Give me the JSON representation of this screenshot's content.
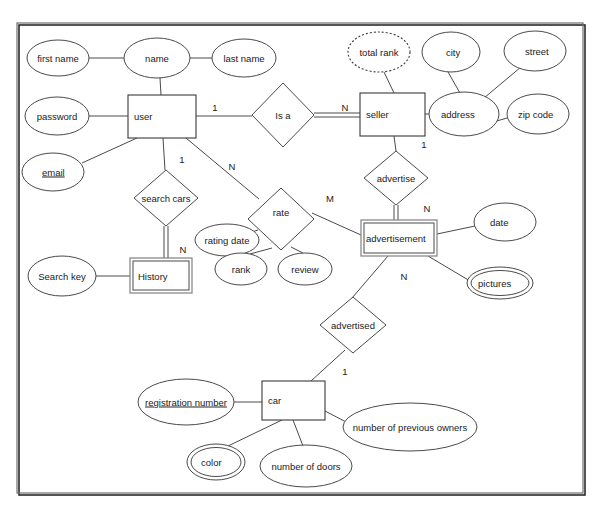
{
  "diagram": {
    "type": "entity-relationship-diagram",
    "notation": "Chen",
    "background": "#ffffff",
    "line_color": "#4a4a4a",
    "frame": {
      "x": 17,
      "y": 23,
      "width": 566,
      "height": 470
    }
  },
  "entities": [
    {
      "id": "user",
      "label": "user",
      "kind": "strong",
      "x": 128,
      "y": 95,
      "w": 68,
      "h": 43
    },
    {
      "id": "seller",
      "label": "seller",
      "kind": "strong",
      "x": 360,
      "y": 93,
      "w": 65,
      "h": 43
    },
    {
      "id": "history",
      "label": "History",
      "kind": "weak",
      "x": 130,
      "y": 258,
      "w": 62,
      "h": 35
    },
    {
      "id": "advertisement",
      "label": "advertisement",
      "kind": "weak",
      "x": 361,
      "y": 220,
      "w": 76,
      "h": 36
    },
    {
      "id": "car",
      "label": "car",
      "kind": "strong",
      "x": 262,
      "y": 381,
      "w": 63,
      "h": 39
    }
  ],
  "relationships": [
    {
      "id": "is-a",
      "label": "Is a",
      "cx": 283,
      "cy": 115,
      "rx": 31,
      "ry": 32
    },
    {
      "id": "search-cars",
      "label": "search cars",
      "cx": 166,
      "cy": 198,
      "rx": 32,
      "ry": 28
    },
    {
      "id": "advertise",
      "label": "advertise",
      "cx": 396,
      "cy": 178,
      "rx": 32,
      "ry": 27
    },
    {
      "id": "rate",
      "label": "rate",
      "cx": 281,
      "cy": 219,
      "rx": 33,
      "ry": 31
    },
    {
      "id": "advertised",
      "label": "advertised",
      "cx": 353,
      "cy": 325,
      "rx": 33,
      "ry": 28
    }
  ],
  "attributes": [
    {
      "id": "first-name",
      "label": "first name",
      "kind": "simple",
      "cx": 58,
      "cy": 58,
      "rx": 31,
      "ry": 18,
      "owner": "name"
    },
    {
      "id": "name",
      "label": "name",
      "kind": "simple",
      "cx": 157,
      "cy": 58,
      "rx": 33,
      "ry": 20,
      "owner": "user"
    },
    {
      "id": "last-name",
      "label": "last name",
      "kind": "simple",
      "cx": 244,
      "cy": 58,
      "rx": 32,
      "ry": 19,
      "owner": "name"
    },
    {
      "id": "password",
      "label": "password",
      "kind": "simple",
      "cx": 57,
      "cy": 116,
      "rx": 32,
      "ry": 19,
      "owner": "user"
    },
    {
      "id": "email",
      "label": "email",
      "kind": "key",
      "cx": 53,
      "cy": 172,
      "rx": 31,
      "ry": 19,
      "owner": "user"
    },
    {
      "id": "total-rank",
      "label": "total rank",
      "kind": "derived",
      "cx": 379,
      "cy": 52,
      "rx": 31,
      "ry": 20,
      "owner": "seller"
    },
    {
      "id": "city",
      "label": "city",
      "cx": 451,
      "cy": 52,
      "rx": 29,
      "ry": 20,
      "kind": "simple",
      "owner": "address"
    },
    {
      "id": "street",
      "label": "street",
      "cx": 535,
      "cy": 51,
      "rx": 31,
      "ry": 20,
      "kind": "simple",
      "owner": "address"
    },
    {
      "id": "address",
      "label": "address",
      "cx": 464,
      "cy": 114,
      "rx": 35,
      "ry": 22,
      "kind": "composite",
      "owner": "seller"
    },
    {
      "id": "zip-code",
      "label": "zip code",
      "cx": 538,
      "cy": 114,
      "rx": 31,
      "ry": 20,
      "kind": "simple",
      "owner": "address"
    },
    {
      "id": "search-key",
      "label": "Search key",
      "cx": 62,
      "cy": 276,
      "rx": 34,
      "ry": 20,
      "kind": "simple",
      "owner": "history"
    },
    {
      "id": "rating-date",
      "label": "rating date",
      "cx": 227,
      "cy": 240,
      "rx": 32,
      "ry": 16,
      "kind": "simple",
      "owner": "rate"
    },
    {
      "id": "rank",
      "label": "rank",
      "cx": 241,
      "cy": 269,
      "rx": 26,
      "ry": 16,
      "kind": "simple",
      "owner": "rate"
    },
    {
      "id": "review",
      "label": "review",
      "cx": 305,
      "cy": 269,
      "rx": 27,
      "ry": 16,
      "kind": "simple",
      "owner": "rate"
    },
    {
      "id": "date",
      "label": "date",
      "cx": 505,
      "cy": 222,
      "rx": 31,
      "ry": 19,
      "kind": "simple",
      "owner": "advertisement"
    },
    {
      "id": "pictures",
      "label": "pictures",
      "cx": 500,
      "cy": 283,
      "rx": 33,
      "ry": 16,
      "kind": "multivalued",
      "owner": "advertisement"
    },
    {
      "id": "reg-number",
      "label": "registration number",
      "cx": 186,
      "cy": 402,
      "rx": 48,
      "ry": 23,
      "kind": "key",
      "owner": "car"
    },
    {
      "id": "prev-owners",
      "label": "number of previous owners",
      "cx": 410,
      "cy": 427,
      "rx": 67,
      "ry": 24,
      "kind": "simple",
      "owner": "car"
    },
    {
      "id": "color",
      "label": "color",
      "cx": 216,
      "cy": 462,
      "rx": 29,
      "ry": 18,
      "kind": "multivalued",
      "owner": "car"
    },
    {
      "id": "doors",
      "label": "number of doors",
      "cx": 306,
      "cy": 466,
      "rx": 46,
      "ry": 21,
      "kind": "simple",
      "owner": "car"
    }
  ],
  "cardinalities": [
    {
      "id": "user-isa",
      "label": "1",
      "x": 215,
      "y": 108
    },
    {
      "id": "isa-seller",
      "label": "N",
      "x": 345,
      "y": 108
    },
    {
      "id": "user-searchcars",
      "label": "1",
      "x": 182,
      "y": 160
    },
    {
      "id": "user-rate",
      "label": "N",
      "x": 232,
      "y": 167
    },
    {
      "id": "searchcars-hist",
      "label": "N",
      "x": 183,
      "y": 250
    },
    {
      "id": "seller-advertise",
      "label": "1",
      "x": 424,
      "y": 145
    },
    {
      "id": "rate-ad",
      "label": "M",
      "x": 330,
      "y": 199
    },
    {
      "id": "advertise-ad",
      "label": "N",
      "x": 427,
      "y": 209
    },
    {
      "id": "ad-advertised",
      "label": "N",
      "x": 404,
      "y": 277
    },
    {
      "id": "advertised-car",
      "label": "1",
      "x": 345,
      "y": 372
    }
  ],
  "edges": [
    {
      "id": "e-firstname-name",
      "from": "first name",
      "to": "name",
      "style": "single"
    },
    {
      "id": "e-name-lastname",
      "from": "name",
      "to": "last name",
      "style": "single"
    },
    {
      "id": "e-name-user",
      "from": "name",
      "to": "user",
      "style": "single"
    },
    {
      "id": "e-password-user",
      "from": "password",
      "to": "user",
      "style": "single"
    },
    {
      "id": "e-email-user",
      "from": "email",
      "to": "user",
      "style": "single"
    },
    {
      "id": "e-user-isa",
      "from": "user",
      "to": "Is a",
      "style": "single"
    },
    {
      "id": "e-isa-seller",
      "from": "Is a",
      "to": "seller",
      "style": "double"
    },
    {
      "id": "e-totalrank-sel",
      "from": "total rank",
      "to": "seller",
      "style": "single"
    },
    {
      "id": "e-seller-addr",
      "from": "seller",
      "to": "address",
      "style": "single"
    },
    {
      "id": "e-city-addr",
      "from": "city",
      "to": "address",
      "style": "single"
    },
    {
      "id": "e-street-addr",
      "from": "street",
      "to": "address",
      "style": "single"
    },
    {
      "id": "e-addr-zip",
      "from": "address",
      "to": "zip code",
      "style": "single"
    },
    {
      "id": "e-user-search",
      "from": "user",
      "to": "search cars",
      "style": "single"
    },
    {
      "id": "e-search-hist",
      "from": "search cars",
      "to": "History",
      "style": "double"
    },
    {
      "id": "e-searchkey-hist",
      "from": "Search key",
      "to": "History",
      "style": "single"
    },
    {
      "id": "e-user-rate",
      "from": "user",
      "to": "rate",
      "style": "single"
    },
    {
      "id": "e-rate-ratedate",
      "from": "rate",
      "to": "rating date",
      "style": "single"
    },
    {
      "id": "e-rate-rank",
      "from": "rate",
      "to": "rank",
      "style": "single"
    },
    {
      "id": "e-rate-review",
      "from": "rate",
      "to": "review",
      "style": "single"
    },
    {
      "id": "e-rate-ad",
      "from": "rate",
      "to": "advertisement",
      "style": "single"
    },
    {
      "id": "e-seller-adv",
      "from": "seller",
      "to": "advertise",
      "style": "single"
    },
    {
      "id": "e-adv-ad",
      "from": "advertise",
      "to": "advertisement",
      "style": "double"
    },
    {
      "id": "e-ad-date",
      "from": "advertisement",
      "to": "date",
      "style": "single"
    },
    {
      "id": "e-ad-pictures",
      "from": "advertisement",
      "to": "pictures",
      "style": "single"
    },
    {
      "id": "e-ad-advertised",
      "from": "advertisement",
      "to": "advertised",
      "style": "single"
    },
    {
      "id": "e-advertised-car",
      "from": "advertised",
      "to": "car",
      "style": "single"
    },
    {
      "id": "e-reg-car",
      "from": "registration number",
      "to": "car",
      "style": "single"
    },
    {
      "id": "e-car-prev",
      "from": "car",
      "to": "number of previous owners",
      "style": "single"
    },
    {
      "id": "e-car-color",
      "from": "car",
      "to": "color",
      "style": "single"
    },
    {
      "id": "e-car-doors",
      "from": "car",
      "to": "number of doors",
      "style": "single"
    }
  ]
}
